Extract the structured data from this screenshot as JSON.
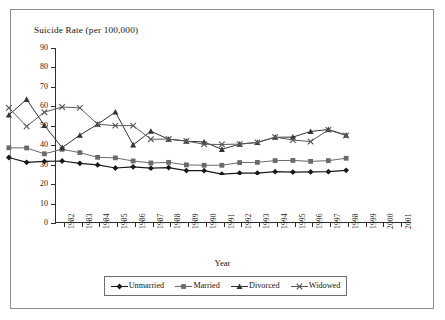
{
  "figure": {
    "title": "Suicide Rate (per 100,000)",
    "x_axis_title": "Year"
  },
  "chart_data": {
    "type": "line",
    "title": "Suicide Rate (per 100,000)",
    "xlabel": "Year",
    "ylabel": "Suicide Rate (per 100,000)",
    "ylim": [
      0,
      90
    ],
    "ytick_labels": [
      "0",
      "10",
      "20",
      "30",
      "40",
      "50",
      "60",
      "70",
      "80",
      "90"
    ],
    "yticks": [
      0,
      10,
      20,
      30,
      40,
      50,
      60,
      70,
      80,
      90
    ],
    "grid": false,
    "legend_position": "bottom",
    "categories": [
      "1982",
      "1983",
      "1984",
      "1985",
      "1986",
      "1987",
      "1988",
      "1989",
      "1990",
      "1991",
      "1992",
      "1993",
      "1994",
      "1995",
      "1996",
      "1997",
      "1998",
      "1999",
      "2000",
      "2001"
    ],
    "series": [
      {
        "name": "Unmarried",
        "marker": "diamond",
        "color": "#1a1a1a",
        "values": [
          9.0,
          6.5,
          7.0,
          7.2,
          6.0,
          5.2,
          3.6,
          4.2,
          3.5,
          3.8,
          2.3,
          2.2,
          0.5,
          1.0,
          1.0,
          1.7,
          1.5,
          1.6,
          1.7,
          2.4
        ]
      },
      {
        "name": "Married",
        "marker": "square",
        "color": "#6a6a6a",
        "values": [
          14.0,
          13.9,
          10.9,
          13.2,
          11.5,
          9.1,
          8.8,
          7.2,
          6.2,
          6.5,
          5.2,
          5.0,
          5.0,
          6.4,
          6.5,
          7.4,
          7.5,
          7.0,
          7.4,
          8.6
        ]
      },
      {
        "name": "Divorced",
        "marker": "triangle",
        "color": "#333333",
        "values": [
          30.9,
          38.9,
          25.5,
          14.1,
          20.5,
          26.1,
          32.4,
          15.5,
          22.5,
          18.4,
          17.4,
          17.0,
          13.2,
          15.9,
          16.7,
          19.4,
          19.5,
          22.4,
          23.4,
          20.5
        ]
      },
      {
        "name": "Widowed",
        "marker": "cross",
        "color": "#5a5a5a",
        "values": [
          34.5,
          25.0,
          32.3,
          35.0,
          34.5,
          26.1,
          25.4,
          25.4,
          18.4,
          18.5,
          17.5,
          15.8,
          15.7,
          15.9,
          16.8,
          19.5,
          18.0,
          17.2,
          23.2,
          20.3
        ]
      }
    ]
  },
  "legend": {
    "items": [
      {
        "label": "Unmarried",
        "marker": "diamond-marker-icon"
      },
      {
        "label": "Married",
        "marker": "square-marker-icon"
      },
      {
        "label": "Divorced",
        "marker": "triangle-marker-icon"
      },
      {
        "label": "Widowed",
        "marker": "cross-marker-icon"
      }
    ]
  }
}
